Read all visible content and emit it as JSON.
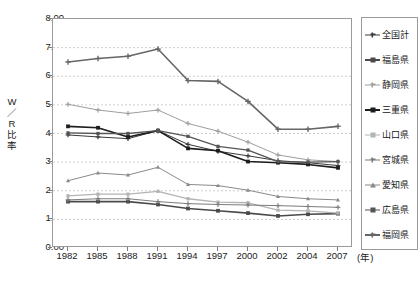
{
  "chart_data": {
    "type": "line",
    "title": "",
    "xlabel": "(年)",
    "ylabel": "W／R比率",
    "ylim": [
      0.0,
      8.0
    ],
    "ytick_labels": [
      "0.00",
      "1.00",
      "2.00",
      "3.00",
      "4.00",
      "5.00",
      "6.00",
      "7.00",
      "8.00"
    ],
    "ytick_values": [
      0,
      1,
      2,
      3,
      4,
      5,
      6,
      7,
      8
    ],
    "categories": [
      "1982",
      "1985",
      "1988",
      "1991",
      "1994",
      "1997",
      "2000",
      "2002",
      "2004",
      "2007"
    ],
    "x": [
      1982,
      1985,
      1988,
      1991,
      1994,
      1997,
      2000,
      2002,
      2004,
      2007
    ],
    "grid": "horizontal-dashed",
    "legend_position": "right",
    "series": [
      {
        "name": "全国計",
        "color": "#3a3a3a",
        "marker": "plus",
        "width": 1.0,
        "values": [
          3.95,
          3.88,
          3.82,
          4.1,
          3.62,
          3.38,
          3.22,
          3.05,
          2.98,
          2.88
        ]
      },
      {
        "name": "福島県",
        "color": "#4a4a4a",
        "marker": "square",
        "width": 1.6,
        "values": [
          1.62,
          1.62,
          1.62,
          1.52,
          1.38,
          1.3,
          1.22,
          1.12,
          1.18,
          1.2
        ]
      },
      {
        "name": "静岡県",
        "color": "#9e9e9e",
        "marker": "plus",
        "width": 1.0,
        "values": [
          5.02,
          4.82,
          4.7,
          4.82,
          4.35,
          4.08,
          3.7,
          3.25,
          3.08,
          3.02
        ]
      },
      {
        "name": "三重県",
        "color": "#1d1d1d",
        "marker": "square",
        "width": 1.6,
        "values": [
          4.25,
          4.2,
          3.88,
          4.1,
          3.48,
          3.4,
          3.02,
          2.98,
          2.92,
          2.8
        ]
      },
      {
        "name": "山口県",
        "color": "#b4b4b4",
        "marker": "square",
        "width": 1.3,
        "values": [
          1.82,
          1.88,
          1.88,
          1.98,
          1.72,
          1.6,
          1.58,
          1.32,
          1.3,
          1.22
        ]
      },
      {
        "name": "宮城県",
        "color": "#7c7c7c",
        "marker": "plus",
        "width": 1.0,
        "values": [
          1.68,
          1.72,
          1.72,
          1.62,
          1.55,
          1.52,
          1.5,
          1.48,
          1.45,
          1.42
        ]
      },
      {
        "name": "愛知県",
        "color": "#8a8a8a",
        "marker": "triangle",
        "width": 1.0,
        "values": [
          2.35,
          2.62,
          2.55,
          2.82,
          2.22,
          2.18,
          2.02,
          1.8,
          1.72,
          1.68
        ]
      },
      {
        "name": "広島県",
        "color": "#555555",
        "marker": "square",
        "width": 1.3,
        "values": [
          4.02,
          4.0,
          4.0,
          4.1,
          3.9,
          3.55,
          3.42,
          3.02,
          3.0,
          3.02
        ]
      },
      {
        "name": "福岡県",
        "color": "#666666",
        "marker": "plus",
        "width": 1.6,
        "values": [
          6.5,
          6.62,
          6.7,
          6.95,
          5.85,
          5.82,
          5.12,
          4.15,
          4.15,
          4.25
        ]
      }
    ]
  }
}
